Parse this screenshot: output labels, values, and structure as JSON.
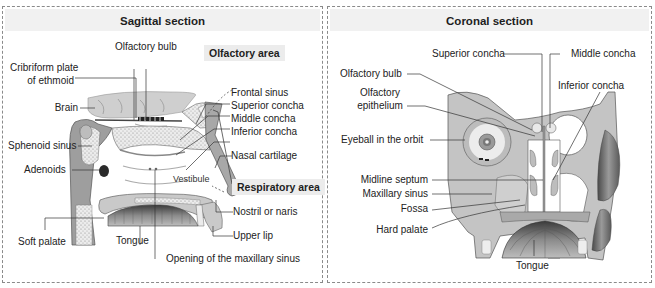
{
  "sagittal": {
    "title": "Sagittal section",
    "area_tags": {
      "olfactory": "Olfactory area",
      "respiratory": "Respiratory area"
    },
    "labels": {
      "olfactory_bulb": "Olfactory bulb",
      "cribriform_1": "Cribriform plate",
      "cribriform_2": "of ethmoid",
      "brain": "Brain",
      "sphenoid_sinus": "Sphenoid sinus",
      "adenoids": "Adenoids",
      "frontal_sinus": "Frontal sinus",
      "superior_concha": "Superior concha",
      "middle_concha": "Middle concha",
      "inferior_concha": "Inferior concha",
      "nasal_cartilage": "Nasal cartilage",
      "vestibule": "Vestibule",
      "nostril": "Nostril or naris",
      "upper_lip": "Upper lip",
      "soft_palate": "Soft palate",
      "tongue": "Tongue",
      "maxillary_opening": "Opening of the maxillary sinus"
    }
  },
  "coronal": {
    "title": "Coronal section",
    "labels": {
      "superior_concha": "Superior concha",
      "middle_concha": "Middle concha",
      "olfactory_bulb": "Olfactory bulb",
      "olfactory_epithelium_1": "Olfactory",
      "olfactory_epithelium_2": "epithelium",
      "inferior_concha": "Inferior concha",
      "eyeball": "Eyeball in the orbit",
      "midline_septum": "Midline septum",
      "maxillary_sinus": "Maxillary sinus",
      "fossa": "Fossa",
      "hard_palate": "Hard palate",
      "tongue": "Tongue"
    }
  },
  "colors": {
    "panel_border": "#8a8a8a",
    "header_bg": "#f1f1f1",
    "tissue": "#c9c9c9",
    "bone": "#e4e4e4",
    "outline": "#555555"
  }
}
